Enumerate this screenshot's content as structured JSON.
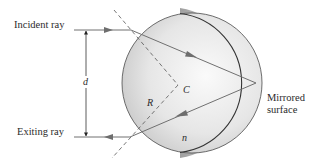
{
  "labels": {
    "incident_ray": "Incident ray",
    "exiting_ray": "Exiting ray",
    "distance": "d",
    "radius": "R",
    "center": "C",
    "index": "n",
    "mirror_line1": "Mirrored",
    "mirror_line2": "surface"
  },
  "geometry": {
    "sphere_center": [
      192,
      83
    ],
    "sphere_radius": 70,
    "entry_point": [
      131,
      30
    ],
    "reflection_point": [
      256,
      83
    ],
    "exit_point": [
      130,
      137
    ],
    "normal_vertex_C": [
      178,
      85
    ]
  },
  "colors": {
    "sphere_light": "#f4f4f4",
    "sphere_dark": "#bdbdbd",
    "mirror_shadow": "#a9a9a9",
    "ray": "#707070",
    "outline": "#4a4a4a",
    "text": "#2b2b2b"
  }
}
